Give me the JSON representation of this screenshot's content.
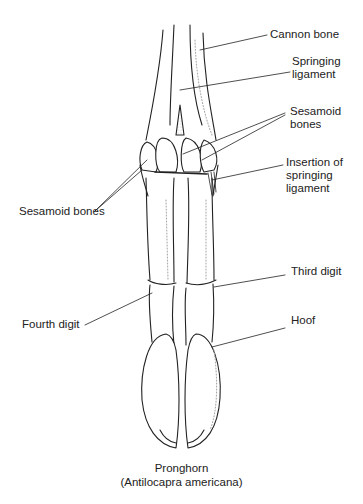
{
  "figure": {
    "title": "Pronghorn",
    "scientific_name": "(Antilocapra americana)",
    "labels": {
      "cannon_bone": "Cannon bone",
      "springing_ligament_1": "Springing",
      "springing_ligament_2": "ligament",
      "sesamoid_right_1": "Sesamoid",
      "sesamoid_right_2": "bones",
      "insertion_1": "Insertion of",
      "insertion_2": "springing",
      "insertion_3": "ligament",
      "sesamoid_left": "Sesamoid bones",
      "third_digit": "Third digit",
      "fourth_digit": "Fourth digit",
      "hoof": "Hoof"
    },
    "colors": {
      "ink": "#222222",
      "background": "#ffffff",
      "stipple": "#999999"
    }
  }
}
